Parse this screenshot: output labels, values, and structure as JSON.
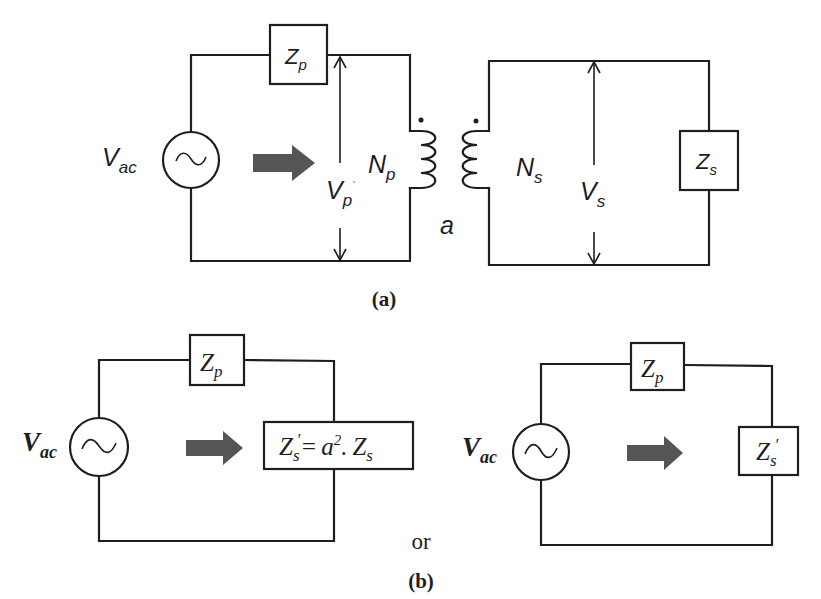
{
  "figure": {
    "panel_a": {
      "caption": "(a)",
      "source_label": {
        "main": "V",
        "sub": "ac"
      },
      "primary_impedance": {
        "main": "Z",
        "sub": "p"
      },
      "primary_voltage": {
        "main": "V",
        "sub": "p",
        "mark": "`"
      },
      "primary_turns": {
        "main": "N",
        "sub": "p"
      },
      "secondary_turns": {
        "main": "N",
        "sub": "s"
      },
      "secondary_voltage": {
        "main": "V",
        "sub": "s"
      },
      "secondary_impedance": {
        "main": "Z",
        "sub": "s"
      },
      "turns_ratio": "a",
      "polarity_dots": 2
    },
    "separator_text": "or",
    "panel_b": {
      "caption": "(b)",
      "left_circuit": {
        "source_label": {
          "main": "V",
          "sub": "ac"
        },
        "primary_impedance": {
          "main": "Z",
          "sub": "p"
        },
        "referred_impedance": {
          "lhs_main": "Z",
          "lhs_sub": "s",
          "prime": "′",
          "equals": "=",
          "a": "a",
          "exp": "2",
          "dot": ".",
          "rhs_main": "Z",
          "rhs_sub": "s"
        }
      },
      "right_circuit": {
        "source_label": {
          "main": "V",
          "sub": "ac"
        },
        "primary_impedance": {
          "main": "Z",
          "sub": "p"
        },
        "referred_impedance": {
          "main": "Z",
          "sub": "s",
          "prime": "′"
        }
      }
    },
    "colors": {
      "line": "#1e1e1e",
      "arrow_fill": "#555555",
      "background": "#ffffff"
    }
  }
}
